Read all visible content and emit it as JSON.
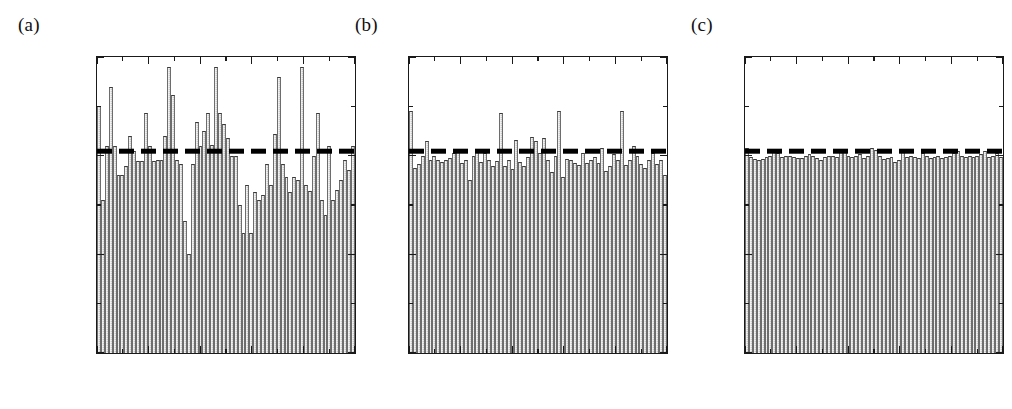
{
  "figure": {
    "panels": [
      {
        "label": "(a)",
        "id": "a",
        "y_axis_title": "p(x)",
        "x_axis_title": "x",
        "show_y_labels": true
      },
      {
        "label": "(b)",
        "id": "b",
        "y_axis_title": "",
        "x_axis_title": "x",
        "show_y_labels": true
      },
      {
        "label": "(c)",
        "id": "c",
        "y_axis_title": "",
        "x_axis_title": "x",
        "show_y_labels": true
      }
    ],
    "y_ticks": [
      "0.00",
      "0.01",
      "0.02",
      "0.03"
    ],
    "x_ticks": [
      "0",
      "0.2",
      "0.4",
      "0.6",
      "0.8",
      "1"
    ],
    "reference_value_label": "0.02",
    "bar_fill_color": "#c9c9c9",
    "bar_edge_color": "#3a3a3a",
    "reference_line_color": "#000000",
    "axis_color": "#1a1a1a"
  },
  "chart_data": [
    {
      "type": "bar",
      "panel": "(a)",
      "title": "",
      "xlabel": "x",
      "ylabel": "p(x)",
      "xlim": [
        0,
        1
      ],
      "ylim": [
        0,
        0.03
      ],
      "grid": false,
      "legend": null,
      "reference_line": {
        "y": 0.02,
        "style": "dashed",
        "width": "thick",
        "color": "#000000"
      },
      "bin_count": 66,
      "categories": [
        "0.0076",
        "0.0227",
        "0.0379",
        "0.053",
        "0.0682",
        "0.0833",
        "0.0985",
        "0.1136",
        "0.1288",
        "0.1439",
        "0.1591",
        "0.1742",
        "0.1894",
        "0.2045",
        "0.2197",
        "0.2348",
        "0.25",
        "0.2652",
        "0.2803",
        "0.2955",
        "0.3106",
        "0.3258",
        "0.3409",
        "0.3561",
        "0.3712",
        "0.3864",
        "0.4015",
        "0.4167",
        "0.4318",
        "0.447",
        "0.4621",
        "0.4773",
        "0.4924",
        "0.5076",
        "0.5227",
        "0.5379",
        "0.553",
        "0.5682",
        "0.5833",
        "0.5985",
        "0.6136",
        "0.6288",
        "0.6439",
        "0.6591",
        "0.6742",
        "0.6894",
        "0.7045",
        "0.7197",
        "0.7348",
        "0.75",
        "0.7652",
        "0.7803",
        "0.7955",
        "0.8106",
        "0.8258",
        "0.8409",
        "0.8561",
        "0.8712",
        "0.8864",
        "0.9015",
        "0.9167",
        "0.9318",
        "0.947",
        "0.9621",
        "0.9773",
        "0.9924"
      ],
      "values": [
        0.025,
        0.0155,
        0.021,
        0.027,
        0.021,
        0.018,
        0.018,
        0.019,
        0.022,
        0.0205,
        0.0195,
        0.0195,
        0.0243,
        0.021,
        0.0195,
        0.0196,
        0.0196,
        0.022,
        0.029,
        0.0262,
        0.0196,
        0.0192,
        0.0134,
        0.01,
        0.0192,
        0.0234,
        0.021,
        0.0225,
        0.0243,
        0.0211,
        0.029,
        0.0243,
        0.0232,
        0.0218,
        0.02,
        0.02,
        0.015,
        0.0122,
        0.017,
        0.0122,
        0.0163,
        0.0155,
        0.016,
        0.0192,
        0.017,
        0.0222,
        0.028,
        0.0192,
        0.0178,
        0.0163,
        0.0178,
        0.0175,
        0.029,
        0.017,
        0.0164,
        0.02,
        0.0243,
        0.0155,
        0.014,
        0.021,
        0.0155,
        0.0165,
        0.0175,
        0.0196,
        0.0185,
        0.021
      ]
    },
    {
      "type": "bar",
      "panel": "(b)",
      "title": "",
      "xlabel": "x",
      "ylabel": "",
      "xlim": [
        0,
        1
      ],
      "ylim": [
        0,
        0.03
      ],
      "grid": false,
      "legend": null,
      "reference_line": {
        "y": 0.02,
        "style": "dashed",
        "width": "thick",
        "color": "#000000"
      },
      "bin_count": 66,
      "categories": [
        "0.0076",
        "0.0227",
        "0.0379",
        "0.053",
        "0.0682",
        "0.0833",
        "0.0985",
        "0.1136",
        "0.1288",
        "0.1439",
        "0.1591",
        "0.1742",
        "0.1894",
        "0.2045",
        "0.2197",
        "0.2348",
        "0.25",
        "0.2652",
        "0.2803",
        "0.2955",
        "0.3106",
        "0.3258",
        "0.3409",
        "0.3561",
        "0.3712",
        "0.3864",
        "0.4015",
        "0.4167",
        "0.4318",
        "0.447",
        "0.4621",
        "0.4773",
        "0.4924",
        "0.5076",
        "0.5227",
        "0.5379",
        "0.553",
        "0.5682",
        "0.5833",
        "0.5985",
        "0.6136",
        "0.6288",
        "0.6439",
        "0.6591",
        "0.6742",
        "0.6894",
        "0.7045",
        "0.7197",
        "0.7348",
        "0.75",
        "0.7652",
        "0.7803",
        "0.7955",
        "0.8106",
        "0.8258",
        "0.8409",
        "0.8561",
        "0.8712",
        "0.8864",
        "0.9015",
        "0.9167",
        "0.9318",
        "0.947",
        "0.9621",
        "0.9773",
        "0.9924"
      ],
      "values": [
        0.0245,
        0.0188,
        0.0192,
        0.02,
        0.0215,
        0.0196,
        0.02,
        0.0196,
        0.0194,
        0.0196,
        0.0198,
        0.0203,
        0.0207,
        0.0193,
        0.0196,
        0.0175,
        0.02,
        0.0206,
        0.0194,
        0.0203,
        0.0196,
        0.019,
        0.0195,
        0.0243,
        0.019,
        0.0196,
        0.0187,
        0.0216,
        0.0194,
        0.019,
        0.0199,
        0.0219,
        0.0215,
        0.0203,
        0.0218,
        0.0196,
        0.0183,
        0.02,
        0.0245,
        0.0178,
        0.0197,
        0.0196,
        0.0193,
        0.0191,
        0.0203,
        0.0193,
        0.0196,
        0.0199,
        0.0193,
        0.0208,
        0.0184,
        0.019,
        0.0202,
        0.0196,
        0.0245,
        0.0191,
        0.0196,
        0.021,
        0.02,
        0.0192,
        0.0188,
        0.0196,
        0.0203,
        0.0192,
        0.0196,
        0.018
      ]
    },
    {
      "type": "bar",
      "panel": "(c)",
      "title": "",
      "xlabel": "x",
      "ylabel": "",
      "xlim": [
        0,
        1
      ],
      "ylim": [
        0,
        0.03
      ],
      "grid": false,
      "legend": null,
      "reference_line": {
        "y": 0.02,
        "style": "dashed",
        "width": "thick",
        "color": "#000000"
      },
      "bin_count": 66,
      "categories": [
        "0.0076",
        "0.0227",
        "0.0379",
        "0.053",
        "0.0682",
        "0.0833",
        "0.0985",
        "0.1136",
        "0.1288",
        "0.1439",
        "0.1591",
        "0.1742",
        "0.1894",
        "0.2045",
        "0.2197",
        "0.2348",
        "0.25",
        "0.2652",
        "0.2803",
        "0.2955",
        "0.3106",
        "0.3258",
        "0.3409",
        "0.3561",
        "0.3712",
        "0.3864",
        "0.4015",
        "0.4167",
        "0.4318",
        "0.447",
        "0.4621",
        "0.4773",
        "0.4924",
        "0.5076",
        "0.5227",
        "0.5379",
        "0.553",
        "0.5682",
        "0.5833",
        "0.5985",
        "0.6136",
        "0.6288",
        "0.6439",
        "0.6591",
        "0.6742",
        "0.6894",
        "0.7045",
        "0.7197",
        "0.7348",
        "0.75",
        "0.7652",
        "0.7803",
        "0.7955",
        "0.8106",
        "0.8258",
        "0.8409",
        "0.8561",
        "0.8712",
        "0.8864",
        "0.9015",
        "0.9167",
        "0.9318",
        "0.947",
        "0.9621",
        "0.9773",
        "0.9924"
      ],
      "values": [
        0.0208,
        0.0199,
        0.0197,
        0.0196,
        0.0197,
        0.0199,
        0.02,
        0.0205,
        0.0203,
        0.0199,
        0.02,
        0.02,
        0.0199,
        0.0198,
        0.0198,
        0.02,
        0.0202,
        0.02,
        0.0198,
        0.0196,
        0.0199,
        0.02,
        0.02,
        0.0199,
        0.0204,
        0.0205,
        0.02,
        0.0199,
        0.02,
        0.0202,
        0.0198,
        0.02,
        0.0208,
        0.0206,
        0.02,
        0.0197,
        0.0198,
        0.0199,
        0.0194,
        0.0196,
        0.0207,
        0.0199,
        0.02,
        0.0199,
        0.0198,
        0.0203,
        0.02,
        0.0198,
        0.0199,
        0.02,
        0.0198,
        0.0199,
        0.02,
        0.0203,
        0.0205,
        0.02,
        0.0199,
        0.02,
        0.0199,
        0.02,
        0.0202,
        0.0205,
        0.0199,
        0.02,
        0.0203,
        0.0199
      ]
    }
  ]
}
